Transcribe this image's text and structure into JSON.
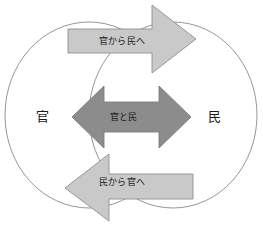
{
  "diagram": {
    "canvas": {
      "width": 263,
      "height": 230,
      "background": "#ffffff"
    },
    "circles": {
      "left": {
        "label": "官",
        "stroke": "#8a8a8a",
        "fill": "#ffffff"
      },
      "right": {
        "label": "民",
        "stroke": "#8a8a8a",
        "fill": "#ffffff"
      }
    },
    "arrows": {
      "top": {
        "label": "官から民へ",
        "direction": "right",
        "fill": "#c9c9c9",
        "stroke": "#8f8f8f"
      },
      "middle": {
        "label": "官と民",
        "direction": "both",
        "fill": "#8c8c8c",
        "stroke": "#7d7d7d"
      },
      "bottom": {
        "label": "民から官へ",
        "direction": "left",
        "fill": "#c9c9c9",
        "stroke": "#8f8f8f"
      }
    }
  }
}
